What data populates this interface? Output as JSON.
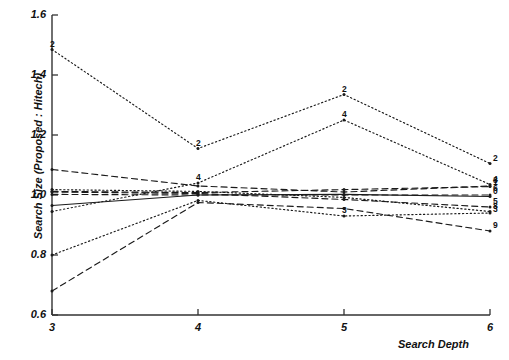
{
  "chart_data": {
    "type": "line",
    "title": "",
    "xlabel": "Search Depth",
    "ylabel": "Search Size (Proposed : Hitech)",
    "x": [
      3,
      4,
      5,
      6
    ],
    "xlim": [
      3,
      6
    ],
    "ylim": [
      0.6,
      1.6
    ],
    "xticks": [
      "3",
      "4",
      "5",
      "6"
    ],
    "yticks": [
      "0.6",
      "0.8",
      "1.0",
      "1.2",
      "1.4",
      "1.6"
    ],
    "grid": false,
    "legend": "point-labels",
    "series": [
      {
        "name": "2",
        "label": "2",
        "style": "dotted",
        "values": [
          1.485,
          1.155,
          1.335,
          1.105
        ]
      },
      {
        "name": "4",
        "label": "4",
        "style": "dotted",
        "values": [
          0.945,
          1.04,
          1.25,
          1.035
        ]
      },
      {
        "name": "3",
        "label": "3",
        "style": "dashed",
        "values": [
          1.085,
          1.03,
          1.01,
          1.03
        ]
      },
      {
        "name": "0",
        "label": "0",
        "style": "solid",
        "values": [
          0.965,
          1.0,
          1.002,
          0.995
        ]
      },
      {
        "name": "1",
        "label": "1",
        "style": "dashed",
        "values": [
          1.012,
          1.008,
          1.018,
          1.028
        ]
      },
      {
        "name": "6",
        "label": "6",
        "style": "dashed",
        "values": [
          1.002,
          1.0,
          1.0,
          1.0
        ]
      },
      {
        "name": "5",
        "label": "5",
        "style": "dashed",
        "values": [
          1.01,
          1.005,
          0.985,
          0.96
        ]
      },
      {
        "name": "8",
        "label": "8",
        "style": "dotted",
        "values": [
          1.018,
          1.012,
          0.992,
          0.945
        ]
      },
      {
        "name": "7",
        "label": "3",
        "style": "dotted",
        "values": [
          0.8,
          0.982,
          0.93,
          0.94
        ]
      },
      {
        "name": "9",
        "label": "9",
        "style": "dashed",
        "values": [
          0.68,
          0.975,
          0.955,
          0.88
        ]
      }
    ],
    "point_labels": [
      {
        "series": "2",
        "x": 3,
        "y": 1.485,
        "text": "2"
      },
      {
        "series": "2",
        "x": 4,
        "y": 1.155,
        "text": "2"
      },
      {
        "series": "2",
        "x": 5,
        "y": 1.335,
        "text": "2"
      },
      {
        "series": "2",
        "x": 6,
        "y": 1.105,
        "text": "2"
      },
      {
        "series": "4",
        "x": 4,
        "y": 1.04,
        "text": "4"
      },
      {
        "series": "4",
        "x": 5,
        "y": 1.25,
        "text": "4"
      },
      {
        "series": "4",
        "x": 6,
        "y": 1.035,
        "text": "4"
      },
      {
        "series": "3",
        "x": 6,
        "y": 1.03,
        "text": "3"
      },
      {
        "series": "1",
        "x": 6,
        "y": 1.022,
        "text": "1"
      },
      {
        "series": "6",
        "x": 6,
        "y": 1.005,
        "text": "6"
      },
      {
        "series": "0",
        "x": 6,
        "y": 0.995,
        "text": "0"
      },
      {
        "series": "5",
        "x": 6,
        "y": 0.96,
        "text": "5"
      },
      {
        "series": "8",
        "x": 6,
        "y": 0.945,
        "text": "8"
      },
      {
        "series": "7",
        "x": 6,
        "y": 0.935,
        "text": "3"
      },
      {
        "series": "9",
        "x": 6,
        "y": 0.88,
        "text": "9"
      },
      {
        "series": "7",
        "x": 5,
        "y": 0.93,
        "text": "3"
      }
    ],
    "colors": {
      "ink": "#1a1a1a",
      "axis": "#333333",
      "background": "#ffffff"
    }
  }
}
